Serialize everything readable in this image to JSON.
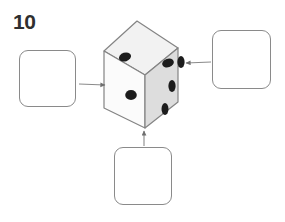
{
  "page": {
    "question_number": "10",
    "width": 285,
    "height": 222,
    "background_color": "#ffffff"
  },
  "diagram": {
    "type": "isometric-die",
    "faces": [
      {
        "id": "top",
        "name": "top-face",
        "pip_count": 2,
        "fill_color": "#f2f2f2"
      },
      {
        "id": "front-left",
        "name": "front-left-face",
        "pip_count": 1,
        "fill_color": "#fbfbfb"
      },
      {
        "id": "right",
        "name": "right-face",
        "pip_count": 3,
        "fill_color": "#dedede"
      }
    ],
    "pip_color": "#1c1c1c",
    "edge_color": "#7d7d7d",
    "hidden_edge_style": "dashed"
  },
  "answer_boxes": [
    {
      "id": "left",
      "name": "answer-box-left",
      "value": "",
      "points_to": "front-left-face"
    },
    {
      "id": "right",
      "name": "answer-box-right",
      "value": "",
      "points_to": "right-face"
    },
    {
      "id": "bottom",
      "name": "answer-box-bottom",
      "value": "",
      "points_to": "front-left-face-bottom"
    }
  ],
  "arrows": [
    {
      "id": "left-arrow",
      "name": "arrow-left-to-cube",
      "direction": "right"
    },
    {
      "id": "right-arrow",
      "name": "arrow-right-to-cube",
      "direction": "left"
    },
    {
      "id": "bottom-arrow",
      "name": "arrow-bottom-to-cube",
      "direction": "up"
    }
  ],
  "colors": {
    "box_border": "#8a8a8a",
    "arrow": "#8a8a8a",
    "text": "#2f2f2f"
  }
}
